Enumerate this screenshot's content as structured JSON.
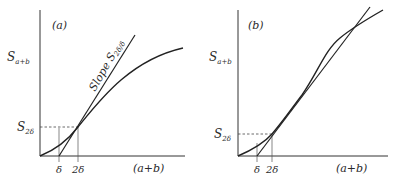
{
  "panels": [
    {
      "id": "a",
      "panel_label": "(a)",
      "y_axis_label": "S",
      "y_axis_label_sub": "a+b",
      "x_axis_label": "(a+b)",
      "y_marker_label": "S",
      "y_marker_label_sub": "2δ",
      "x_tick_1": "δ",
      "x_tick_2": "2δ",
      "line_annotation": "Slope S",
      "line_annotation_sub": "2δ/δ",
      "curve_shape": "concave"
    },
    {
      "id": "b",
      "panel_label": "(b)",
      "y_axis_label": "S",
      "y_axis_label_sub": "a+b",
      "x_axis_label": "(a+b)",
      "y_marker_label": "S",
      "y_marker_label_sub": "2δ",
      "x_tick_1": "δ",
      "x_tick_2": "2δ",
      "curve_shape": "sigmoid"
    }
  ]
}
